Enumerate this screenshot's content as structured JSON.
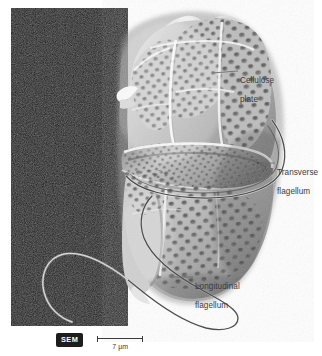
{
  "figure": {
    "technique": "SEM",
    "background_panel_color": "#101010",
    "label_color": "#3b3b3b",
    "leader_color": "#6b6b6b"
  },
  "labels": [
    {
      "id": "cellulose-plate",
      "text": "Cellulose\nplate",
      "line1": "Cellulose",
      "line2": "plate"
    },
    {
      "id": "transverse-flagellum",
      "text": "Transverse\nflagellum",
      "line1": "Transverse",
      "line2": "flagellum"
    },
    {
      "id": "longitudinal-flagellum",
      "text": "Longitudinal\nflagellum",
      "line1": "Longitudinal",
      "line2": "flagellum"
    }
  ],
  "scale": {
    "badge": "SEM",
    "value": "7 µm",
    "number": 7,
    "unit": "µm"
  }
}
